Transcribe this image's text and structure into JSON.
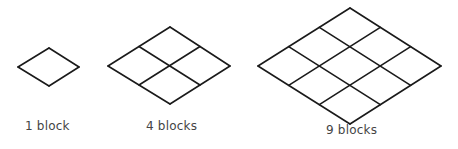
{
  "diagram": {
    "stroke_color": "#1a1a1a",
    "figures": [
      {
        "grid": 1,
        "label": "1 block",
        "left": [
          18,
          67
        ],
        "top": [
          49,
          48
        ],
        "right": [
          79,
          67
        ],
        "bottom": [
          49,
          86
        ],
        "label_pos": [
          25,
          119
        ]
      },
      {
        "grid": 2,
        "label": "4 blocks",
        "left": [
          108,
          66
        ],
        "top": [
          170,
          27
        ],
        "right": [
          230,
          66
        ],
        "bottom": [
          170,
          104
        ],
        "label_pos": [
          146,
          119
        ]
      },
      {
        "grid": 3,
        "label": "9 blocks",
        "left": [
          258,
          66
        ],
        "top": [
          350,
          8
        ],
        "right": [
          441,
          66
        ],
        "bottom": [
          350,
          124
        ],
        "label_pos": [
          326,
          123
        ]
      }
    ]
  }
}
